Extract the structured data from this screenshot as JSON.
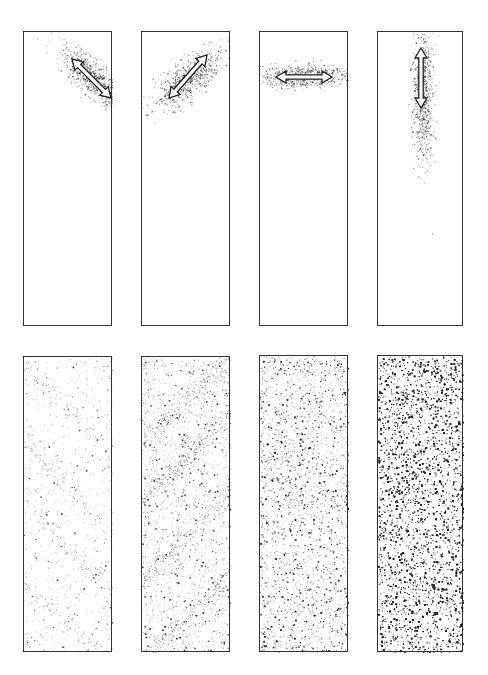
{
  "figure": {
    "background": "#ffffff",
    "stroke_color": "#333333",
    "dot_color": "#222222",
    "rows": [
      {
        "name": "top-row",
        "panels": [
          {
            "id": "a1",
            "x": 23,
            "y": 31,
            "w": 89,
            "h": 295,
            "cloud": {
              "cx": 68,
              "cy": 45,
              "sx": 32,
              "sy": 12,
              "angle": 42,
              "count": 700
            },
            "arrow": {
              "x1": 48,
              "y1": 27,
              "x2": 87,
              "y2": 66
            }
          },
          {
            "id": "a2",
            "x": 141,
            "y": 31,
            "w": 89,
            "h": 295,
            "cloud": {
              "cx": 45,
              "cy": 48,
              "sx": 36,
              "sy": 13,
              "angle": -40,
              "count": 700
            },
            "arrow": {
              "x1": 27,
              "y1": 66,
              "x2": 65,
              "y2": 23
            }
          },
          {
            "id": "a3",
            "x": 259,
            "y": 31,
            "w": 89,
            "h": 295,
            "cloud": {
              "cx": 44,
              "cy": 44,
              "sx": 42,
              "sy": 9,
              "angle": 0,
              "count": 650
            },
            "arrow": {
              "x1": 16,
              "y1": 45,
              "x2": 72,
              "y2": 45
            }
          },
          {
            "id": "a4",
            "x": 377,
            "y": 31,
            "w": 86,
            "h": 295,
            "cloud": {
              "cx": 45,
              "cy": 60,
              "sx": 8,
              "sy": 55,
              "angle": 0,
              "count": 700
            },
            "arrow": {
              "x1": 43,
              "y1": 16,
              "x2": 43,
              "y2": 76
            }
          }
        ]
      },
      {
        "name": "bottom-row",
        "panels": [
          {
            "id": "b1",
            "x": 23,
            "y": 356,
            "w": 89,
            "h": 296,
            "density": 600,
            "dark_ratio": 0.18
          },
          {
            "id": "b2",
            "x": 141,
            "y": 356,
            "w": 89,
            "h": 296,
            "density": 1600,
            "dark_ratio": 0.25
          },
          {
            "id": "b3",
            "x": 259,
            "y": 355,
            "w": 89,
            "h": 297,
            "density": 3200,
            "dark_ratio": 0.3
          },
          {
            "id": "b4",
            "x": 377,
            "y": 355,
            "w": 86,
            "h": 297,
            "density": 9000,
            "dark_ratio": 0.45
          }
        ]
      }
    ]
  }
}
